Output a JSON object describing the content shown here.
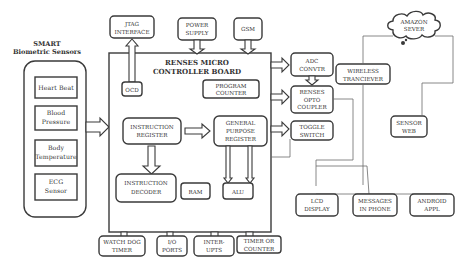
{
  "sensors": {
    "title_line1": "SMART",
    "title_line2": "Biometric Sensors",
    "items": [
      {
        "line1": "Heart Beat",
        "line2": ""
      },
      {
        "line1": "Blood",
        "line2": "Pressure"
      },
      {
        "line1": "Body",
        "line2": "Temperature"
      },
      {
        "line1": "ECG",
        "line2": "Sensor"
      }
    ]
  },
  "board": {
    "title_line1": "RENSES MICRO",
    "title_line2": "CONTROLLER BOARD",
    "ocd": "OCD",
    "program_counter": {
      "line1": "PROGRAM",
      "line2": "COUNTER"
    },
    "instruction_register": {
      "line1": "INSTRUCTION",
      "line2": "REGISTER"
    },
    "general_purpose_register": {
      "line1": "GENERAL",
      "line2": "PURPOSE",
      "line3": "REGISTER"
    },
    "instruction_decoder": {
      "line1": "INSTRUCTION",
      "line2": "DECODER"
    },
    "ram": "RAM",
    "alu": "ALU"
  },
  "top": {
    "jtag": {
      "line1": "JTAG",
      "line2": "INTERFACE"
    },
    "power": {
      "line1": "POWER",
      "line2": "SUPPLY"
    },
    "gsm": "GSM"
  },
  "right": {
    "adc": {
      "line1": "ADC",
      "line2": "CONVTR"
    },
    "opto": {
      "line1": "RENSES",
      "line2": "OPTO",
      "line3": "COUPLER"
    },
    "toggle": {
      "line1": "TOGGLE",
      "line2": "SWITCH"
    },
    "wireless": {
      "line1": "WIRELESS",
      "line2": "TRANCIEVER"
    },
    "cloud": {
      "line1": "AMAZON",
      "line2": "SEVER"
    },
    "sensor_web": {
      "line1": "SENSOR",
      "line2": "WEB"
    }
  },
  "outputs": {
    "lcd": {
      "line1": "LCD",
      "line2": "DISPLAY"
    },
    "messages": {
      "line1": "MESSAGES",
      "line2": "IN PHONE"
    },
    "android": {
      "line1": "ANDROID",
      "line2": "APPL"
    }
  },
  "bottom": {
    "watchdog": {
      "line1": "WATCH DOG",
      "line2": "TIMER"
    },
    "io": {
      "line1": "I/O",
      "line2": "PORTS"
    },
    "interrupts": {
      "line1": "INTER-",
      "line2": "UPTS"
    },
    "timer": {
      "line1": "TIMER OR",
      "line2": "COUNTER"
    }
  }
}
